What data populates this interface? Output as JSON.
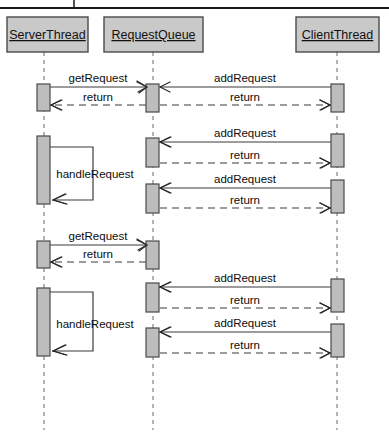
{
  "diagram": {
    "type": "uml-sequence-diagram",
    "title": "",
    "background_color": "#ffffff",
    "box_fill_color": "#c9c9c9",
    "activation_fill_color": "#bdbdbd",
    "line_color": "#3a3a3a",
    "lifeline_color": "#8c8c8c"
  },
  "participants": [
    {
      "id": "server",
      "label": "ServerThread",
      "x": 44,
      "box_x": 7,
      "box_y": 17,
      "box_w": 81,
      "box_h": 35
    },
    {
      "id": "queue",
      "label": "RequestQueue",
      "x": 153,
      "box_x": 104,
      "box_y": 17,
      "box_w": 99,
      "box_h": 35
    },
    {
      "id": "client",
      "label": "ClientThread",
      "x": 337,
      "box_x": 296,
      "box_y": 17,
      "box_w": 83,
      "box_h": 35
    }
  ],
  "messages": [
    {
      "index": 1,
      "label": "getRequest",
      "from": "server",
      "to": "queue",
      "kind": "call",
      "y": 87,
      "label_x": 98,
      "label_y": 82
    },
    {
      "index": 2,
      "label": "addRequest",
      "from": "client",
      "to": "queue",
      "kind": "call",
      "y": 87,
      "label_x": 245,
      "label_y": 82
    },
    {
      "index": 3,
      "label": "return",
      "from": "queue",
      "to": "server",
      "kind": "return",
      "y": 105,
      "label_x": 98,
      "label_y": 101
    },
    {
      "index": 4,
      "label": "return",
      "from": "queue",
      "to": "client",
      "kind": "return",
      "y": 105,
      "label_x": 245,
      "label_y": 101
    },
    {
      "index": 5,
      "label": "addRequest",
      "from": "client",
      "to": "queue",
      "kind": "call",
      "y": 142,
      "label_x": 245,
      "label_y": 137
    },
    {
      "index": 6,
      "label": "return",
      "from": "queue",
      "to": "client",
      "kind": "return",
      "y": 163,
      "label_x": 245,
      "label_y": 159
    },
    {
      "index": 7,
      "label": "handleRequest",
      "from": "server",
      "to": "server",
      "kind": "self",
      "y_start": 147,
      "y_end": 200,
      "label_x": 95,
      "label_y": 178
    },
    {
      "index": 8,
      "label": "addRequest",
      "from": "client",
      "to": "queue",
      "kind": "call",
      "y": 188,
      "label_x": 245,
      "label_y": 183
    },
    {
      "index": 9,
      "label": "return",
      "from": "queue",
      "to": "client",
      "kind": "return",
      "y": 208,
      "label_x": 245,
      "label_y": 204
    },
    {
      "index": 10,
      "label": "getRequest",
      "from": "server",
      "to": "queue",
      "kind": "call",
      "y": 245,
      "label_x": 98,
      "label_y": 240
    },
    {
      "index": 11,
      "label": "return",
      "from": "queue",
      "to": "server",
      "kind": "return",
      "y": 262,
      "label_x": 98,
      "label_y": 258
    },
    {
      "index": 12,
      "label": "addRequest",
      "from": "client",
      "to": "queue",
      "kind": "call",
      "y": 287,
      "label_x": 245,
      "label_y": 282
    },
    {
      "index": 13,
      "label": "return",
      "from": "queue",
      "to": "client",
      "kind": "return",
      "y": 308,
      "label_x": 245,
      "label_y": 304
    },
    {
      "index": 14,
      "label": "handleRequest",
      "from": "server",
      "to": "server",
      "kind": "self",
      "y_start": 292,
      "y_end": 351,
      "label_x": 95,
      "label_y": 328
    },
    {
      "index": 15,
      "label": "addRequest",
      "from": "client",
      "to": "queue",
      "kind": "call",
      "y": 332,
      "label_x": 245,
      "label_y": 327
    },
    {
      "index": 16,
      "label": "return",
      "from": "queue",
      "to": "client",
      "kind": "return",
      "y": 353,
      "label_x": 245,
      "label_y": 349
    }
  ],
  "activations": [
    {
      "participant": "server",
      "x": 37,
      "y": 84,
      "w": 13,
      "h": 27
    },
    {
      "participant": "server",
      "x": 37,
      "y": 136,
      "w": 13,
      "h": 68
    },
    {
      "participant": "server",
      "x": 37,
      "y": 241,
      "w": 13,
      "h": 27
    },
    {
      "participant": "server",
      "x": 37,
      "y": 288,
      "w": 13,
      "h": 68
    },
    {
      "participant": "queue",
      "x": 146,
      "y": 84,
      "w": 13,
      "h": 28
    },
    {
      "participant": "queue",
      "x": 146,
      "y": 138,
      "w": 13,
      "h": 29
    },
    {
      "participant": "queue",
      "x": 146,
      "y": 184,
      "w": 13,
      "h": 29
    },
    {
      "participant": "queue",
      "x": 146,
      "y": 241,
      "w": 13,
      "h": 28
    },
    {
      "participant": "queue",
      "x": 146,
      "y": 283,
      "w": 13,
      "h": 29
    },
    {
      "participant": "queue",
      "x": 146,
      "y": 328,
      "w": 13,
      "h": 29
    },
    {
      "participant": "client",
      "x": 331,
      "y": 84,
      "w": 13,
      "h": 28
    },
    {
      "participant": "client",
      "x": 331,
      "y": 134,
      "w": 13,
      "h": 33
    },
    {
      "participant": "client",
      "x": 331,
      "y": 180,
      "w": 13,
      "h": 33
    },
    {
      "participant": "client",
      "x": 331,
      "y": 279,
      "w": 13,
      "h": 33
    },
    {
      "participant": "client",
      "x": 331,
      "y": 324,
      "w": 13,
      "h": 33
    }
  ],
  "lifeline_bottom_y": 430
}
